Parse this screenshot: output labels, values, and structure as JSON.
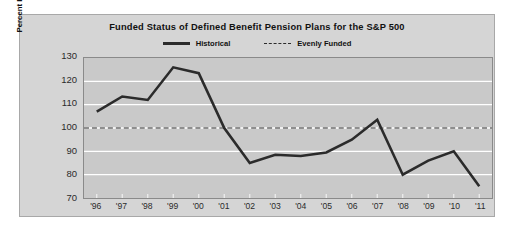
{
  "chart_data": {
    "type": "line",
    "title": "Funded Status of Defined Benefit Pension Plans for the S&P 500",
    "xlabel": "",
    "ylabel": "Percent Funded",
    "categories": [
      "'96",
      "'97",
      "'98",
      "'99",
      "'00",
      "'01",
      "'02",
      "'03",
      "'04",
      "'05",
      "'06",
      "'07",
      "'08",
      "'09",
      "'10",
      "'11"
    ],
    "ylim": [
      70,
      130
    ],
    "yticks": [
      130,
      120,
      110,
      100,
      90,
      80,
      70
    ],
    "grid": true,
    "legend_position": "top-center",
    "series": [
      {
        "name": "Historical",
        "style": "solid",
        "color": "#2b2b2b",
        "values": [
          107,
          113.5,
          112,
          126,
          123.5,
          100,
          85,
          88.5,
          88,
          89.5,
          95,
          103.5,
          80,
          86,
          90,
          75
        ]
      },
      {
        "name": "Evenly Funded",
        "style": "dashed",
        "color": "#2b2b2b",
        "constant_value": 100
      }
    ]
  },
  "legend": {
    "historical_label": "Historical",
    "evenly_funded_label": "Evenly Funded"
  },
  "colors": {
    "card_background": "#d5d5d5",
    "plot_background": "#c9c9c9",
    "line": "#2b2b2b",
    "gridline": "#ffffff",
    "axis_border": "#8a8a8a"
  }
}
